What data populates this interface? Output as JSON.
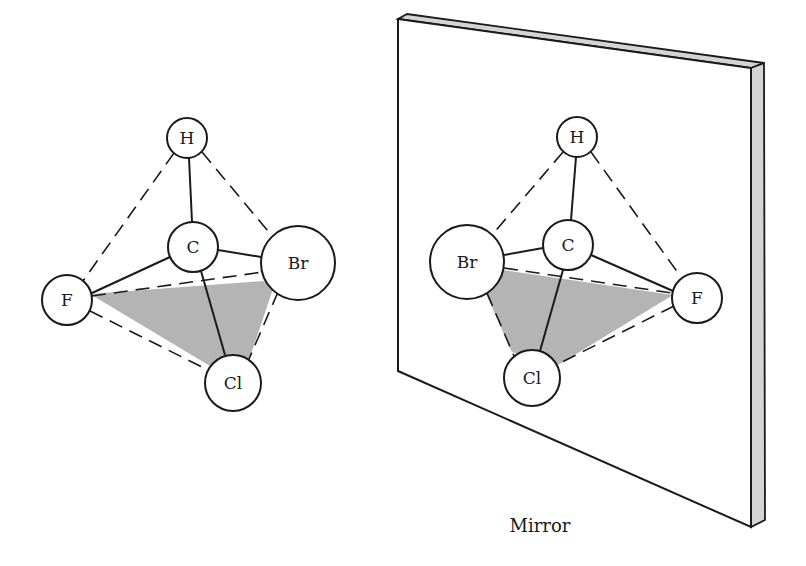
{
  "figure": {
    "caption": "Mirror",
    "colors": {
      "ink": "#1a1a1a",
      "shaded_face": "#b4b4b4",
      "mirror_edge": "#d4d4d4",
      "background": "#ffffff"
    }
  },
  "molecule_left": {
    "atoms": [
      {
        "symbol": "H",
        "x": 187,
        "y": 138,
        "r": 20
      },
      {
        "symbol": "C",
        "x": 193,
        "y": 247,
        "r": 25
      },
      {
        "symbol": "Br",
        "x": 298,
        "y": 263,
        "r": 37
      },
      {
        "symbol": "F",
        "x": 67,
        "y": 300,
        "r": 25
      },
      {
        "symbol": "Cl",
        "x": 233,
        "y": 383,
        "r": 28
      }
    ]
  },
  "molecule_right": {
    "atoms": [
      {
        "symbol": "H",
        "x": 577,
        "y": 137,
        "r": 20
      },
      {
        "symbol": "C",
        "x": 568,
        "y": 245,
        "r": 25
      },
      {
        "symbol": "Br",
        "x": 467,
        "y": 262,
        "r": 37
      },
      {
        "symbol": "F",
        "x": 697,
        "y": 298,
        "r": 25
      },
      {
        "symbol": "Cl",
        "x": 532,
        "y": 378,
        "r": 28
      }
    ]
  }
}
